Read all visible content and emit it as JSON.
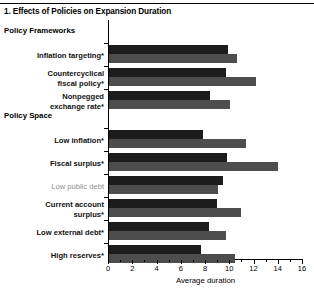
{
  "panel": {
    "title": "1. Effects of Policies on Expansion Duration"
  },
  "chart_data": {
    "type": "bar",
    "orientation": "horizontal",
    "title": "1. Effects of Policies on Expansion Duration",
    "xlabel": "Average duration",
    "ylabel": "",
    "xlim": [
      0,
      16
    ],
    "xticks": [
      0,
      2,
      4,
      6,
      8,
      10,
      12,
      14,
      16
    ],
    "xtick_labels": [
      "0",
      "2",
      "4",
      "6",
      "8",
      "10",
      "12",
      "14",
      "16"
    ],
    "minor_ticks_per_interval": 1,
    "grid": false,
    "legend": null,
    "groups": [
      {
        "name": "Policy Frameworks",
        "categories": [
          {
            "label": "Inflation targeting*",
            "significant": true,
            "without": 9.9,
            "with": 10.6
          },
          {
            "label": "Countercyclical\nfiscal policy*",
            "significant": true,
            "without": 9.7,
            "with": 12.2
          },
          {
            "label": "Nonpegged\nexchange rate*",
            "significant": true,
            "without": 8.4,
            "with": 10.1
          }
        ]
      },
      {
        "name": "Policy Space",
        "categories": [
          {
            "label": "Low inflation*",
            "significant": true,
            "without": 7.8,
            "with": 11.4
          },
          {
            "label": "Fiscal surplus*",
            "significant": true,
            "without": 9.8,
            "with": 14.0
          },
          {
            "label": "Low public debt",
            "significant": false,
            "without": 9.5,
            "with": 9.1
          },
          {
            "label": "Current account\nsurplus*",
            "significant": true,
            "without": 9.0,
            "with": 11.0
          },
          {
            "label": "Low external debt*",
            "significant": true,
            "without": 8.3,
            "with": 9.7
          },
          {
            "label": "High reserves*",
            "significant": true,
            "without": 7.7,
            "with": 10.5
          }
        ]
      }
    ],
    "series": [
      {
        "name": "dark-series",
        "color": "#1c1c1c",
        "values": [
          9.9,
          9.7,
          8.4,
          7.8,
          9.8,
          9.5,
          9.0,
          8.3,
          7.7
        ]
      },
      {
        "name": "light-series",
        "color": "#4d4d4d",
        "values": [
          10.6,
          12.2,
          10.1,
          11.4,
          14.0,
          9.1,
          11.0,
          9.7,
          10.5
        ]
      }
    ],
    "categories_flat": [
      "Inflation targeting*",
      "Countercyclical fiscal policy*",
      "Nonpegged exchange rate*",
      "Low inflation*",
      "Fiscal surplus*",
      "Low public debt",
      "Current account surplus*",
      "Low external debt*",
      "High reserves*"
    ]
  },
  "colors": {
    "dark_bar": "#1c1c1c",
    "light_bar": "#4d4d4d",
    "muted_label": "#8f8f8f",
    "axis": "#000000"
  }
}
